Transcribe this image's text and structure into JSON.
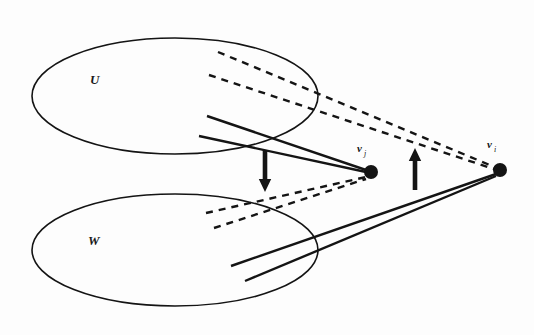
{
  "figure": {
    "background_color": "#fdfdfd",
    "ink_color": "#141414"
  },
  "sets": [
    {
      "id": "set-u",
      "label": "U",
      "cx": 175,
      "cy": 96,
      "rx": 143,
      "ry": 58,
      "label_x": 90,
      "label_y": 84
    },
    {
      "id": "set-w",
      "label": "W",
      "cx": 175,
      "cy": 250,
      "rx": 143,
      "ry": 56,
      "label_x": 88,
      "label_y": 245
    }
  ],
  "nodes": [
    {
      "id": "node-vj",
      "label": "v",
      "subscript": "j",
      "cx": 371,
      "cy": 172,
      "r": 7,
      "label_x": 357,
      "label_y": 152,
      "sub_x": 364,
      "sub_y": 156
    },
    {
      "id": "node-vi",
      "label": "v",
      "subscript": "i",
      "cx": 500,
      "cy": 170,
      "r": 7,
      "label_x": 487,
      "label_y": 148,
      "sub_x": 494,
      "sub_y": 152
    }
  ],
  "edges": {
    "dashed_from_u_to_vi": [
      {
        "id": "dash-u-1",
        "x1": 218,
        "y1": 52,
        "x2": 497,
        "y2": 168
      },
      {
        "id": "dash-u-2",
        "x1": 209,
        "y1": 75,
        "x2": 497,
        "y2": 170
      }
    ],
    "dashed_from_w_to_vj": [
      {
        "id": "dash-w-1",
        "x1": 206,
        "y1": 213,
        "x2": 366,
        "y2": 177
      },
      {
        "id": "dash-w-2",
        "x1": 214,
        "y1": 228,
        "x2": 366,
        "y2": 179
      }
    ],
    "solid_from_u_to_vj": [
      {
        "id": "solid-u-1",
        "x1": 207,
        "y1": 116,
        "x2": 366,
        "y2": 170
      },
      {
        "id": "solid-u-2",
        "x1": 199,
        "y1": 136,
        "x2": 366,
        "y2": 172
      }
    ],
    "solid_from_w_to_vi": [
      {
        "id": "solid-w-1",
        "x1": 231,
        "y1": 266,
        "x2": 496,
        "y2": 174
      },
      {
        "id": "solid-w-2",
        "x1": 245,
        "y1": 281,
        "x2": 496,
        "y2": 176
      }
    ]
  },
  "arrows": [
    {
      "id": "arrow-down",
      "direction": "down",
      "x": 265,
      "y_top": 150,
      "y_bottom": 192
    },
    {
      "id": "arrow-up",
      "direction": "up",
      "x": 415,
      "y_top": 148,
      "y_bottom": 190
    }
  ],
  "style": {
    "ellipse_stroke_width": 1.6,
    "solid_stroke_width": 2.4,
    "dashed_stroke_width": 2.4,
    "dash_pattern": "7 6"
  }
}
